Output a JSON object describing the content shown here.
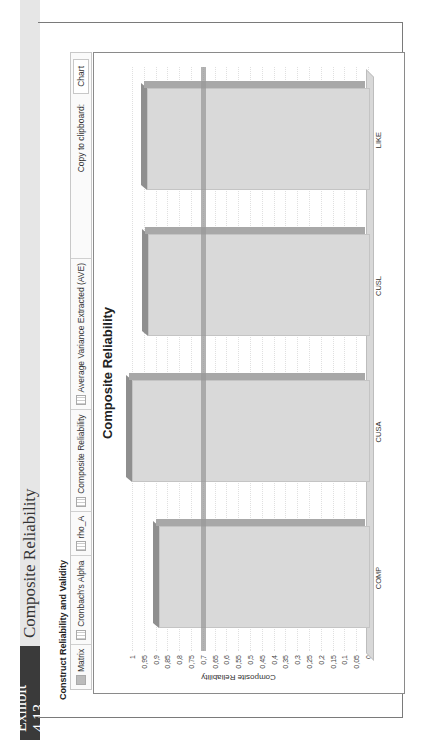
{
  "exhibit": {
    "label": "Exhibit 4.13",
    "title": "Composite Reliability"
  },
  "section_title": "Construct Reliability and Validity",
  "tabs": [
    {
      "label": "Matrix",
      "icon": "matrix-icon"
    },
    {
      "label": "Cronbach's Alpha",
      "icon": "table-icon"
    },
    {
      "label": "rho_A",
      "icon": "table-icon"
    },
    {
      "label": "Composite Reliability",
      "icon": "table-icon"
    },
    {
      "label": "Average Variance Extracted (AVE)",
      "icon": "table-icon"
    }
  ],
  "clipboard": {
    "label": "Copy to clipboard:",
    "chart_button": "Chart"
  },
  "chart_data": {
    "type": "bar",
    "title": "Composite Reliability",
    "xlabel": "",
    "ylabel": "Composite Reliability",
    "categories": [
      "COMP",
      "CUSA",
      "CUSL",
      "LIKE"
    ],
    "values": [
      0.886,
      1.0,
      0.932,
      0.936
    ],
    "ylim": [
      0,
      1
    ],
    "yticks": [
      "1",
      "0,95",
      "0,9",
      "0,85",
      "0,8",
      "0,75",
      "0,7",
      "0,65",
      "0,6",
      "0,55",
      "0,5",
      "0,45",
      "0,4",
      "0,35",
      "0,3",
      "0,25",
      "0,2",
      "0,15",
      "0,1",
      "0,05",
      "0"
    ],
    "threshold_line": 0.7,
    "grid": true,
    "style": "3d",
    "bar_color": "#d9d9d9",
    "bar_top_color": "#8f8f8f",
    "threshold_color": "#9a9a9a"
  }
}
